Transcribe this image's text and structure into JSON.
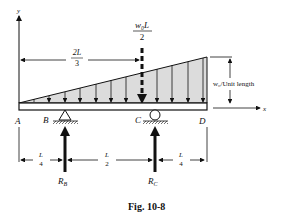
{
  "figure": {
    "caption": "Fig. 10-8",
    "axes": {
      "y_label": "y",
      "x_label": "x"
    },
    "points": {
      "A": "A",
      "B": "B",
      "C": "C",
      "D": "D"
    },
    "resultant": {
      "numerator": "w₀L",
      "denominator": "2"
    },
    "resultant_distance": {
      "numerator": "2L",
      "denominator": "3"
    },
    "load_intensity_label": "w₀/Unit length",
    "reactions": {
      "RB": "R",
      "RB_sub": "B",
      "RC": "R",
      "RC_sub": "C"
    },
    "dimensions": [
      {
        "numerator": "L",
        "denominator": "4"
      },
      {
        "numerator": "L",
        "denominator": "2"
      },
      {
        "numerator": "L",
        "denominator": "4"
      }
    ],
    "load_type": "triangular distributed load, zero at A increasing to w₀ at D",
    "colors": {
      "load_fill": "#dcdcdc",
      "ink": "#111111"
    }
  }
}
